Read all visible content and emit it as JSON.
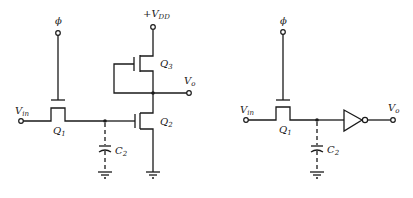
{
  "diagram": {
    "type": "circuit-schematic",
    "left_circuit": {
      "title": "Dynamic inverter with depletion-load",
      "labels": {
        "phi": "ϕ",
        "vdd_prefix": "+V",
        "vdd_sub": "DD",
        "vin": "V",
        "vin_sub": "in",
        "vo": "V",
        "vo_sub": "o",
        "q1": "Q",
        "q1_sub": "1",
        "q2": "Q",
        "q2_sub": "2",
        "q3": "Q",
        "q3_sub": "3",
        "c2": "C",
        "c2_sub": "2"
      }
    },
    "right_circuit": {
      "title": "Equivalent with inverter symbol",
      "labels": {
        "phi": "ϕ",
        "vin": "V",
        "vin_sub": "in",
        "vo": "V",
        "vo_sub": "o",
        "q1": "Q",
        "q1_sub": "1",
        "c2": "C",
        "c2_sub": "2"
      }
    },
    "colors": {
      "line": "#1a1a1a",
      "background": "#ffffff"
    }
  }
}
